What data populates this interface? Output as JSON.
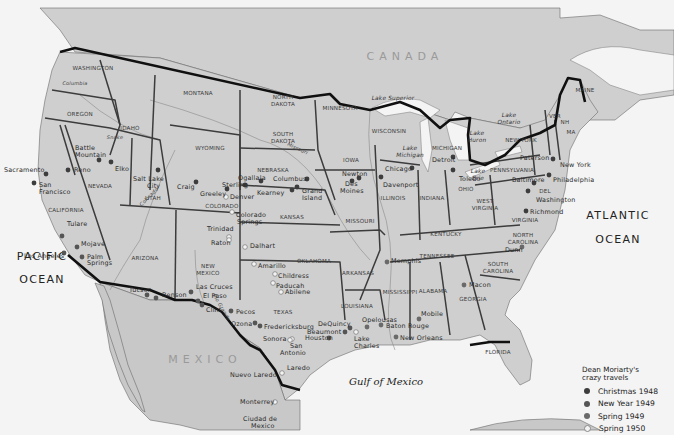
{
  "map": {
    "countries": [
      "CANADA",
      "MEXICO"
    ],
    "oceans": [
      {
        "line1": "PACIFIC",
        "line2": "OCEAN"
      },
      {
        "line1": "ATLANTIC",
        "line2": "OCEAN"
      }
    ],
    "gulf": "Gulf of Mexico",
    "lakes": {
      "superior": "Lake Superior",
      "michigan_1": "Lake",
      "michigan_2": "Michigan",
      "huron_1": "Lake",
      "huron_2": "Huron",
      "ontario_1": "Lake",
      "ontario_2": "Ontario",
      "erie_1": "Lake",
      "erie_2": "Erie"
    },
    "rivers": {
      "colorado": "Colorado",
      "snake": "Snake",
      "columbia": "Columbia",
      "missouri": "Missouri",
      "rio_grande": "Rio Grande"
    },
    "states": {
      "washington": "WASHINGTON",
      "oregon": "OREGON",
      "idaho": "IDAHO",
      "montana": "MONTANA",
      "wyoming": "WYOMING",
      "nevada": "NEVADA",
      "california": "CALIFORNIA",
      "utah": "UTAH",
      "colorado": "COLORADO",
      "arizona": "ARIZONA",
      "new_mexico_1": "NEW",
      "new_mexico_2": "MEXICO",
      "north_dakota_1": "NORTH",
      "north_dakota_2": "DAKOTA",
      "south_dakota_1": "SOUTH",
      "south_dakota_2": "DAKOTA",
      "nebraska": "NEBRASKA",
      "kansas": "KANSAS",
      "oklahoma": "OKLAHOMA",
      "texas": "TEXAS",
      "minnesota": "MINNESOTA",
      "iowa": "IOWA",
      "missouri": "MISSOURI",
      "arkansas": "ARKANSAS",
      "louisiana": "LOUISIANA",
      "wisconsin": "WISCONSIN",
      "illinois": "ILLINOIS",
      "michigan": "MICHIGAN",
      "indiana": "INDIANA",
      "ohio": "OHIO",
      "kentucky": "KENTUCKY",
      "tennessee": "TENNESSEE",
      "mississippi": "MISSISSIPPI",
      "alabama": "ALABAMA",
      "georgia": "GEORGIA",
      "florida": "FLORIDA",
      "south_carolina_1": "SOUTH",
      "south_carolina_2": "CAROLINA",
      "north_carolina_1": "NORTH",
      "north_carolina_2": "CAROLINA",
      "virginia": "VIRGINIA",
      "west_virginia_1": "WEST",
      "west_virginia_2": "VIRGINIA",
      "pennsylvania": "PENNSYLVANIA",
      "new_york": "NEW YORK",
      "maine": "MAINE",
      "vermont": "VER",
      "new_hampshire": "NH",
      "massachusetts": "MA",
      "delaware": "DEL"
    },
    "cities": {
      "sacramento": "Sacramento",
      "san_francisco_1": "San",
      "san_francisco_2": "Francisco",
      "reno": "Reno",
      "battle_mountain_1": "Battle",
      "battle_mountain_2": "Mountain",
      "elko": "Elko",
      "tulare": "Tulare",
      "los_angeles": "Los Angeles",
      "mojave": "Mojave",
      "palm_springs_1": "Palm",
      "palm_springs_2": "Springs",
      "salt_lake_city_1": "Salt Lake",
      "salt_lake_city_2": "City",
      "craig": "Craig",
      "greeley": "Greeley",
      "denver": "Denver",
      "sterling": "Sterling",
      "ogallala": "Ogallala",
      "kearney": "Kearney",
      "columbus": "Columbus",
      "grand_island_1": "Grand",
      "grand_island_2": "Island",
      "colorado_springs_1": "Colorado",
      "colorado_springs_2": "Springs",
      "trinidad": "Trinidad",
      "raton": "Raton",
      "tucson": "Tucson",
      "benson": "Benson",
      "las_cruces": "Las Cruces",
      "el_paso": "El Paso",
      "clint": "Clint",
      "pecos": "Pecos",
      "ozona": "Ozona",
      "fredericksburg": "Fredericksburg",
      "sonora": "Sonora",
      "san_antonio_1": "San",
      "san_antonio_2": "Antonio",
      "laredo": "Laredo",
      "nuevo_laredo": "Nuevo Laredo",
      "monterrey": "Monterrey",
      "ciudad_de_mexico_1": "Ciudad de",
      "ciudad_de_mexico_2": "Mexico",
      "dalhart": "Dalhart",
      "amarillo": "Amarillo",
      "childress": "Childress",
      "paducah": "Paducah",
      "abilene": "Abilene",
      "houston": "Houston",
      "beaumont": "Beaumont",
      "dequincy": "DeQuincy",
      "lake_charles_1": "Lake",
      "lake_charles_2": "Charles",
      "opelousas": "Opelousas",
      "baton_rouge": "Baton Rouge",
      "new_orleans": "New Orleans",
      "mobile": "Mobile",
      "macon": "Macon",
      "dunn": "Dunn",
      "memphis": "Memphis",
      "newton": "Newton",
      "des_moines_1": "Des",
      "des_moines_2": "Moines",
      "davenport": "Davenport",
      "chicago": "Chicago",
      "detroit": "Detroit",
      "toledo": "Toledo",
      "paterson": "Paterson",
      "new_york": "New York",
      "philadelphia": "Philadelphia",
      "baltimore": "Baltimore",
      "washington": "Washington",
      "richmond": "Richmond"
    }
  },
  "legend": {
    "title_1": "Dean Moriarty's",
    "title_2": "crazy travels",
    "items": [
      {
        "label": "Christmas 1948",
        "color": "#3d3d3d"
      },
      {
        "label": "New Year 1949",
        "color": "#555555"
      },
      {
        "label": "Spring 1949",
        "color": "#6a6a6a"
      },
      {
        "label": "Spring 1950",
        "color": "#f3f3f3"
      }
    ]
  }
}
